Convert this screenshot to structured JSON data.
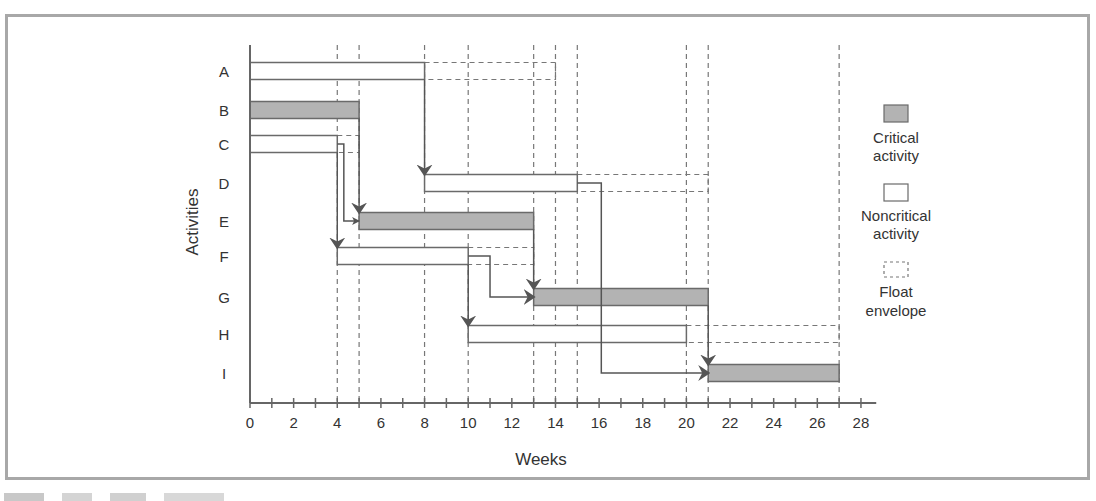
{
  "chart_data": {
    "type": "gantt",
    "title": "",
    "xlabel": "Weeks",
    "ylabel": "Activities",
    "x_ticks": [
      0,
      2,
      4,
      6,
      8,
      10,
      12,
      14,
      16,
      18,
      20,
      22,
      24,
      26,
      28
    ],
    "xlim": [
      0,
      28
    ],
    "grid_weeks": [
      4,
      5,
      8,
      10,
      13,
      14,
      15,
      20,
      21,
      27
    ],
    "activities": [
      {
        "name": "A",
        "start": 0,
        "end": 8,
        "float_end": 14,
        "critical": false
      },
      {
        "name": "B",
        "start": 0,
        "end": 5,
        "float_end": null,
        "critical": true
      },
      {
        "name": "C",
        "start": 0,
        "end": 4,
        "float_end": 5,
        "critical": false
      },
      {
        "name": "D",
        "start": 8,
        "end": 15,
        "float_end": 21,
        "critical": false
      },
      {
        "name": "E",
        "start": 5,
        "end": 13,
        "float_end": null,
        "critical": true
      },
      {
        "name": "F",
        "start": 4,
        "end": 10,
        "float_end": 13,
        "critical": false
      },
      {
        "name": "G",
        "start": 13,
        "end": 21,
        "float_end": null,
        "critical": true
      },
      {
        "name": "H",
        "start": 10,
        "end": 20,
        "float_end": 27,
        "critical": false
      },
      {
        "name": "I",
        "start": 21,
        "end": 27,
        "float_end": null,
        "critical": true
      }
    ],
    "dependencies": [
      {
        "from": "A",
        "to": "D"
      },
      {
        "from": "B",
        "to": "E"
      },
      {
        "from": "C",
        "to": "E"
      },
      {
        "from": "C",
        "to": "F"
      },
      {
        "from": "D",
        "to": "I"
      },
      {
        "from": "E",
        "to": "G"
      },
      {
        "from": "F",
        "to": "G"
      },
      {
        "from": "F",
        "to": "H"
      },
      {
        "from": "G",
        "to": "I"
      }
    ],
    "legend": [
      {
        "key": "critical",
        "label_line1": "Critical",
        "label_line2": "activity"
      },
      {
        "key": "noncritical",
        "label_line1": "Noncritical",
        "label_line2": "activity"
      },
      {
        "key": "float",
        "label_line1": "Float",
        "label_line2": "envelope"
      }
    ]
  },
  "colors": {
    "critical_fill": "#b3b3b3",
    "bar_stroke": "#6a6a6a",
    "arrow": "#555555",
    "frame": "#a8a8a8",
    "text": "#333333"
  }
}
